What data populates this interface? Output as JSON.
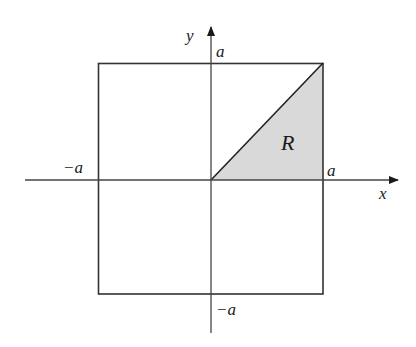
{
  "diagram": {
    "type": "coordinate-region",
    "axes": {
      "x_label": "x",
      "y_label": "y"
    },
    "tick_labels": {
      "x_positive": "a",
      "x_negative": "−a",
      "y_positive": "a",
      "y_negative": "−a"
    },
    "region": {
      "label": "R",
      "vertices": [
        [
          0,
          0
        ],
        [
          1,
          0
        ],
        [
          1,
          1
        ]
      ],
      "fill_color": "#d9d9d9"
    },
    "square": {
      "x_range": [
        -1,
        1
      ],
      "y_range": [
        -1,
        1
      ]
    },
    "colors": {
      "stroke": "#333333",
      "axis": "#444444",
      "background": "#ffffff"
    }
  }
}
